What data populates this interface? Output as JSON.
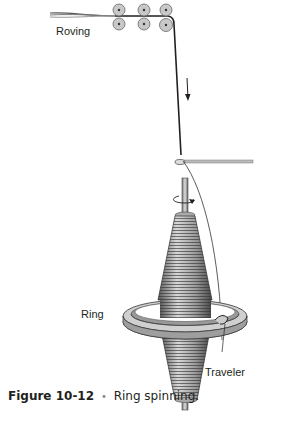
{
  "diagram": {
    "labels": {
      "roving": "Roving",
      "ring": "Ring",
      "traveler": "Traveler"
    },
    "components": [
      "drafting-rollers",
      "yarn",
      "thread-guide",
      "spindle",
      "bobbin",
      "ring",
      "traveler",
      "rotation-arrow",
      "direction-arrow"
    ],
    "colors": {
      "roller_fill": "#c8c8c8",
      "line": "#231f20",
      "bobbin": "#9a9a9a"
    }
  },
  "caption": {
    "number": "Figure 10-12",
    "separator": "•",
    "text": "Ring spinning."
  }
}
